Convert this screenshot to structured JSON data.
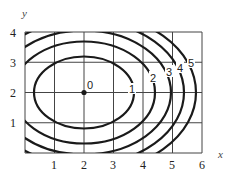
{
  "diagram": {
    "type": "contour_map",
    "x_axis": {
      "label": "x",
      "ticks": [
        "1",
        "2",
        "3",
        "4",
        "5",
        "6"
      ]
    },
    "y_axis": {
      "label": "y",
      "ticks": [
        "1",
        "2",
        "3",
        "4"
      ]
    },
    "center_point": {
      "x": 2,
      "y": 2,
      "label": "0"
    },
    "contour_labels": [
      "0",
      "1",
      "2",
      "3",
      "4",
      "5"
    ],
    "level_curves": [
      {
        "level": "1",
        "label": "1"
      },
      {
        "level": "2",
        "label": "2"
      },
      {
        "level": "3",
        "label": "3"
      },
      {
        "level": "4",
        "label": "4"
      },
      {
        "level": "5",
        "label": "5"
      }
    ]
  },
  "colors": {
    "curve": "#1a1a1a",
    "grid": "#444444",
    "background": "#ffffff"
  }
}
